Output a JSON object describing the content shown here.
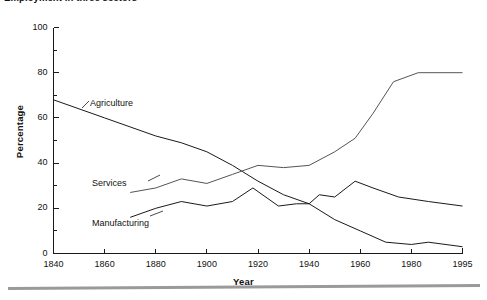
{
  "figure": {
    "caption_clipped": "Employment in three sectors"
  },
  "axes": {
    "y_title": "Percentage",
    "x_title": "Year",
    "y_ticks": [
      "0",
      "20",
      "40",
      "60",
      "80",
      "100"
    ],
    "x_ticks": [
      "1840",
      "1860",
      "1880",
      "1900",
      "1920",
      "1940",
      "1960",
      "1980",
      "1995"
    ]
  },
  "annotations": {
    "agriculture": "Agriculture",
    "services": "Services",
    "manufacturing": "Manufacturing"
  },
  "chart_data": {
    "type": "line",
    "title": "Employment in three sectors",
    "xlabel": "Year",
    "ylabel": "Percentage",
    "xlim": [
      1840,
      1995
    ],
    "ylim": [
      0,
      100
    ],
    "grid": false,
    "legend": "inline-annotations",
    "x_tick_values": [
      1840,
      1860,
      1880,
      1900,
      1920,
      1940,
      1960,
      1980,
      1995
    ],
    "y_tick_values": [
      0,
      20,
      40,
      60,
      80,
      100
    ],
    "y_minor_tick_interval": 10,
    "line_color": "#1a1a1a",
    "series": [
      {
        "name": "Agriculture",
        "color": "#1a1a1a",
        "points": [
          [
            1840,
            68
          ],
          [
            1860,
            60
          ],
          [
            1870,
            56
          ],
          [
            1880,
            52
          ],
          [
            1890,
            49
          ],
          [
            1900,
            45
          ],
          [
            1910,
            39
          ],
          [
            1920,
            32
          ],
          [
            1930,
            26
          ],
          [
            1940,
            22
          ],
          [
            1950,
            15
          ],
          [
            1960,
            10
          ],
          [
            1970,
            5
          ],
          [
            1980,
            4
          ],
          [
            1985,
            5
          ],
          [
            1995,
            3
          ]
        ]
      },
      {
        "name": "Services",
        "color": "#555555",
        "points": [
          [
            1870,
            27
          ],
          [
            1880,
            29
          ],
          [
            1890,
            33
          ],
          [
            1900,
            31
          ],
          [
            1910,
            35
          ],
          [
            1920,
            39
          ],
          [
            1930,
            38
          ],
          [
            1940,
            39
          ],
          [
            1950,
            45
          ],
          [
            1958,
            51
          ],
          [
            1965,
            62
          ],
          [
            1973,
            76
          ],
          [
            1982,
            80
          ],
          [
            1995,
            80
          ]
        ]
      },
      {
        "name": "Manufacturing",
        "color": "#1a1a1a",
        "points": [
          [
            1870,
            16
          ],
          [
            1880,
            20
          ],
          [
            1890,
            23
          ],
          [
            1900,
            21
          ],
          [
            1910,
            23
          ],
          [
            1918,
            29
          ],
          [
            1928,
            21
          ],
          [
            1935,
            22
          ],
          [
            1940,
            22
          ],
          [
            1944,
            26
          ],
          [
            1950,
            25
          ],
          [
            1958,
            32
          ],
          [
            1965,
            29
          ],
          [
            1975,
            25
          ],
          [
            1985,
            23
          ],
          [
            1995,
            21
          ]
        ]
      }
    ]
  }
}
